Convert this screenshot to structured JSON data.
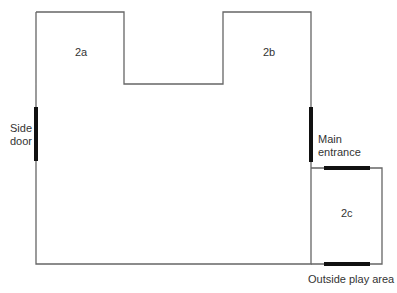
{
  "diagram": {
    "type": "floor-plan",
    "rooms": [
      {
        "id": "2a",
        "label": "2a"
      },
      {
        "id": "2b",
        "label": "2b"
      },
      {
        "id": "2c",
        "label": "2c"
      }
    ],
    "doors": {
      "side_door_line1": "Side",
      "side_door_line2": "door",
      "main_entrance_line1": "Main",
      "main_entrance_line2": "entrance"
    },
    "outside_play_area": "Outside play area",
    "colors": {
      "wall": "#666666",
      "door": "#111111"
    }
  }
}
